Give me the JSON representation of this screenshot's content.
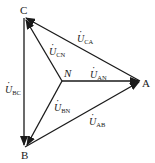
{
  "diagram": {
    "type": "three-phase voltage phasor diagram",
    "nodes": {
      "A": {
        "label": "A",
        "x": 143,
        "y": 82
      },
      "B": {
        "label": "B",
        "x": 25,
        "y": 152
      },
      "C": {
        "label": "C",
        "x": 22,
        "y": 11
      },
      "N": {
        "label": "N",
        "x": 62,
        "y": 80
      }
    },
    "vectors": [
      {
        "id": "U_AN",
        "from": "N",
        "to": "A",
        "symbol": "U",
        "sub": "AN"
      },
      {
        "id": "U_BN",
        "from": "N",
        "to": "B",
        "symbol": "U",
        "sub": "BN"
      },
      {
        "id": "U_CN",
        "from": "N",
        "to": "C",
        "symbol": "U",
        "sub": "CN"
      },
      {
        "id": "U_AB",
        "from": "B",
        "to": "A",
        "symbol": "U",
        "sub": "AB"
      },
      {
        "id": "U_BC",
        "from": "C",
        "to": "B",
        "symbol": "U",
        "sub": "BC"
      },
      {
        "id": "U_CA",
        "from": "A",
        "to": "C",
        "symbol": "U",
        "sub": "CA"
      }
    ],
    "labels": {
      "node_A": "A",
      "node_B": "B",
      "node_C": "C",
      "node_N": "N",
      "u_symbol": "U",
      "sub_AN": "AN",
      "sub_BN": "BN",
      "sub_CN": "CN",
      "sub_AB": "AB",
      "sub_BC": "BC",
      "sub_CA": "CA"
    },
    "colors": {
      "line": "#1a1a1a",
      "background": "#ffffff"
    }
  }
}
